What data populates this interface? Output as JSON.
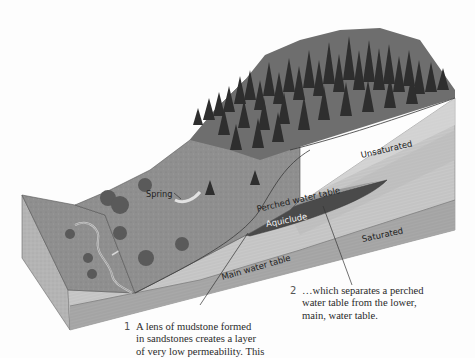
{
  "diagram": {
    "labels": {
      "spring": "Spring",
      "unsaturated": "Unsaturated",
      "perched_water_table": "Perched water table",
      "aquiclude": "Aquiclude",
      "saturated": "Saturated",
      "main_water_table": "Main water table"
    },
    "captions": [
      {
        "number": "1",
        "lines": [
          "A lens of mudstone formed",
          "in sandstones creates a layer",
          "of very low permeability. This"
        ]
      },
      {
        "number": "2",
        "lines": [
          "…which separates a perched",
          "water table from the lower,",
          "main, water table."
        ]
      }
    ],
    "colors": {
      "background": "#fdfdfd",
      "forest": "#3a3a3a",
      "hillside": "#8a8a8a",
      "valley_floor": "#9c9c9c",
      "unsaturated_layer": "#cfcfcf",
      "aquiclude": "#4a4a4a",
      "saturated_layer": "#a9a9a9",
      "front_face": "#bdbdbd",
      "leader_line": "#333333"
    }
  }
}
